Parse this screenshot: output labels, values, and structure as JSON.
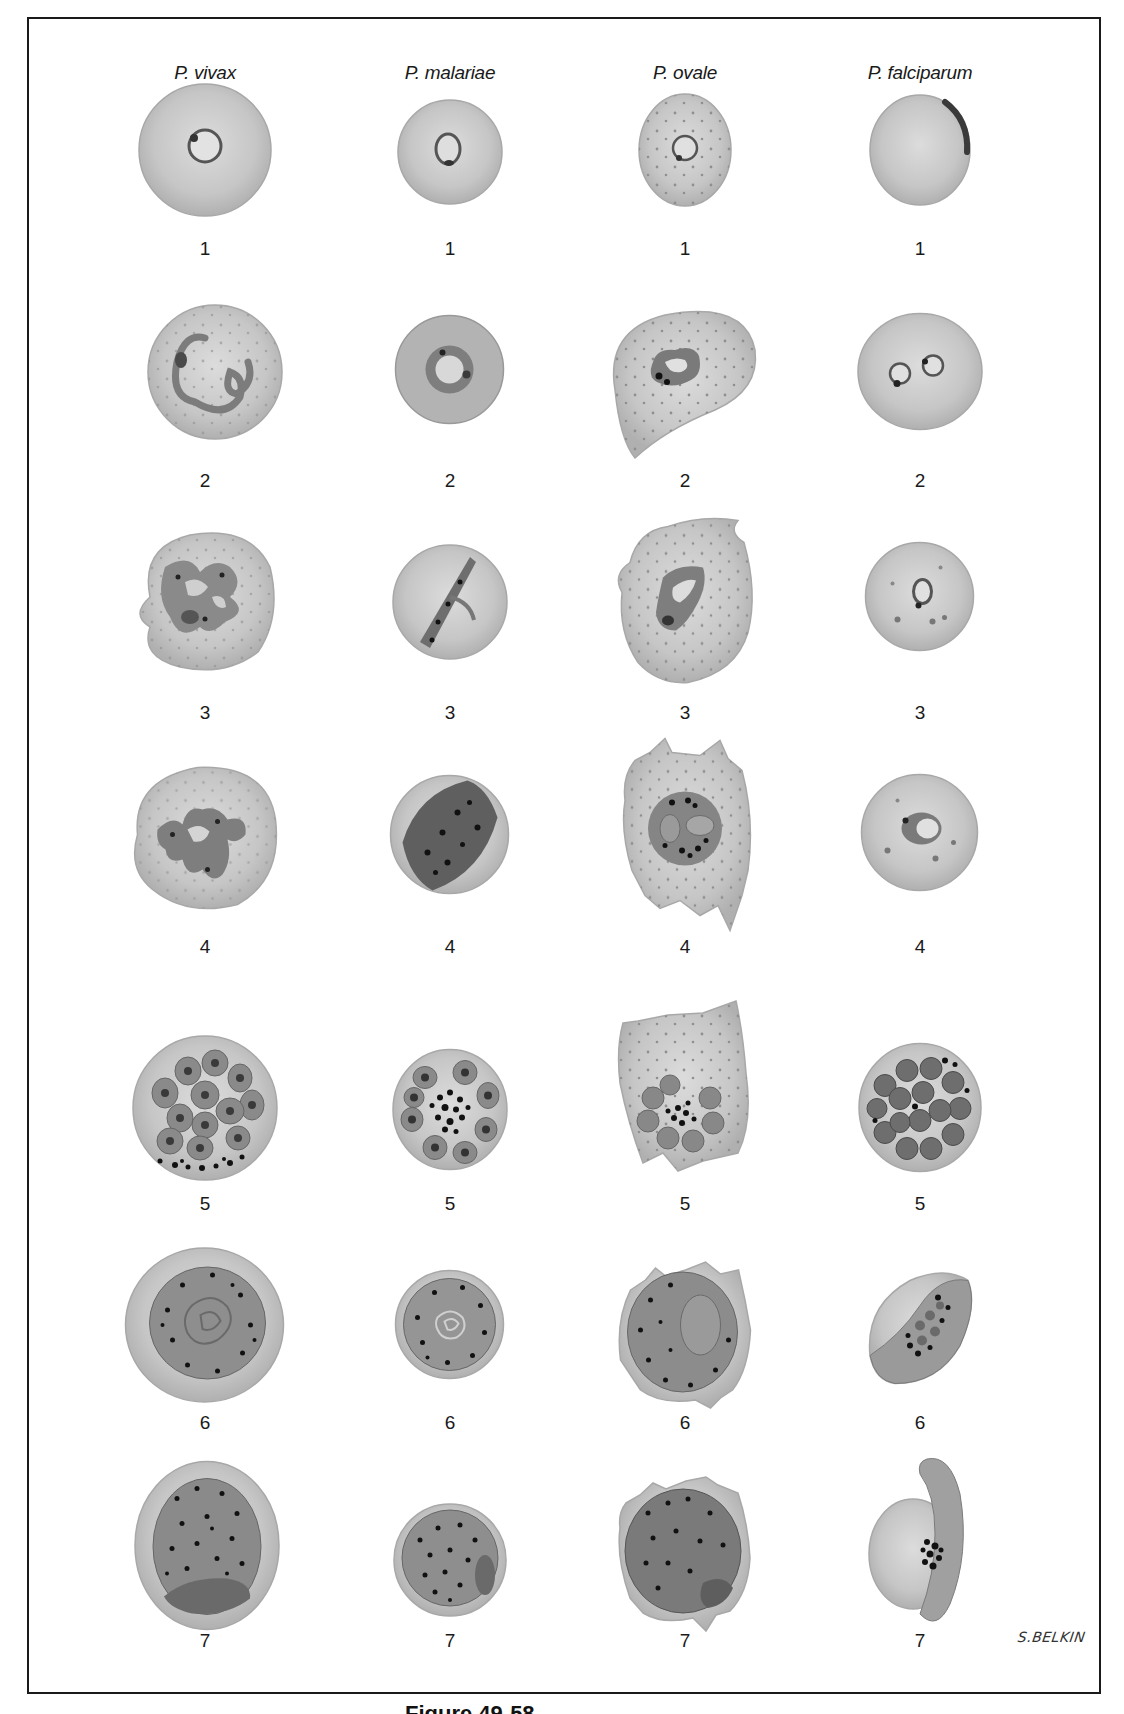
{
  "figure": {
    "columns": [
      {
        "id": "vivax",
        "label": "P. vivax"
      },
      {
        "id": "malariae",
        "label": "P. malariae"
      },
      {
        "id": "ovale",
        "label": "P. ovale"
      },
      {
        "id": "falciparum",
        "label": "P. falciparum"
      }
    ],
    "stage_labels": [
      "1",
      "2",
      "3",
      "4",
      "5",
      "6",
      "7"
    ],
    "signature": "S.BELKIN",
    "caption_partial": "Figure 49-58"
  },
  "colors": {
    "frame": "#1a1a1a",
    "rbc_fill": "#c8c8c8",
    "rbc_edge": "#9a9a9a",
    "parasite_fill": "#8a8a8a",
    "parasite_edge": "#555555",
    "pigment": "#222222",
    "stippling": "#8f8f8f"
  }
}
